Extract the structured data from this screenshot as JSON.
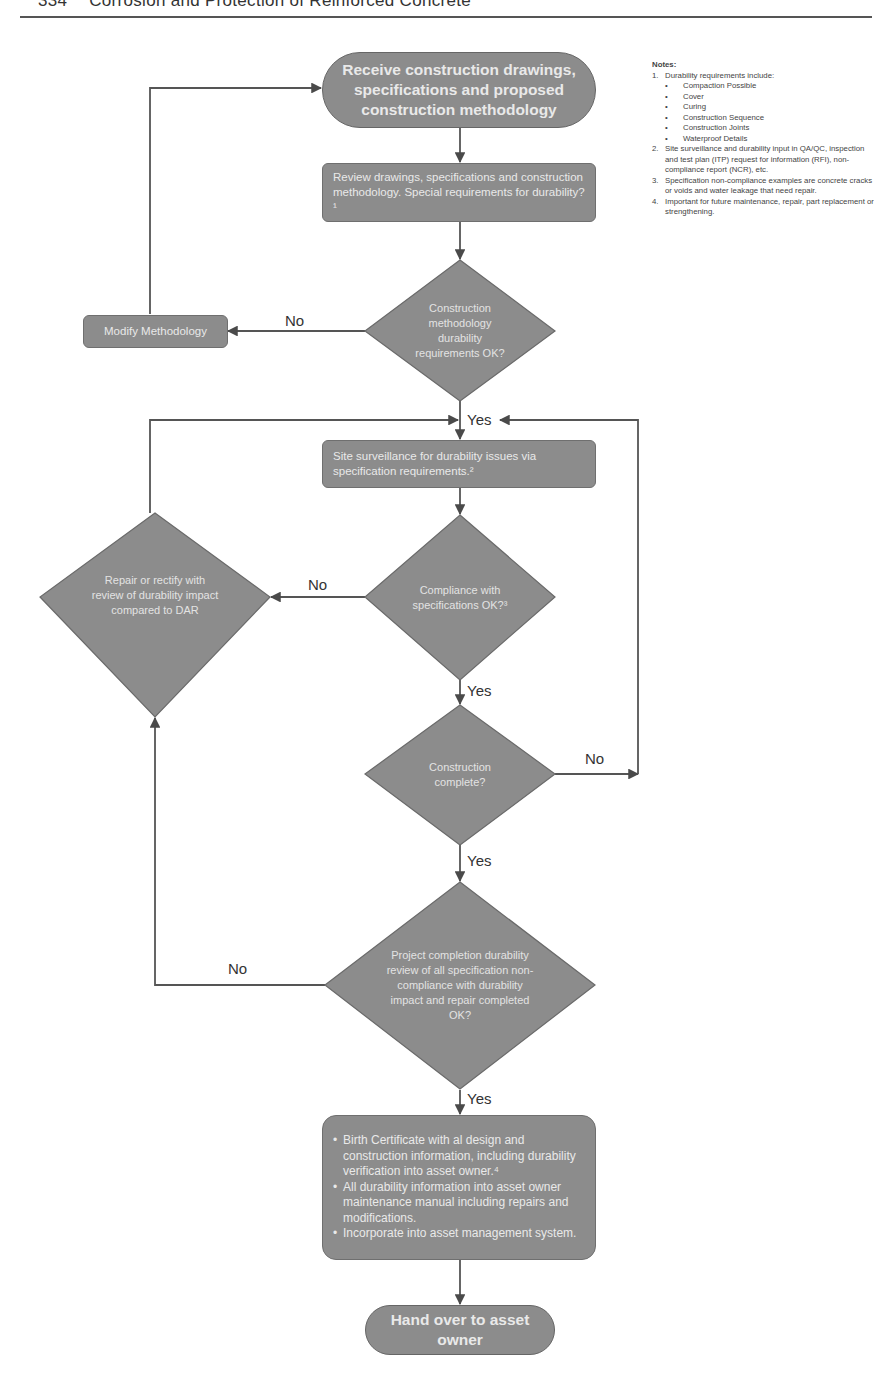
{
  "header": {
    "page_number": "334",
    "title": "Corrosion and Protection of Reinforced Concrete"
  },
  "notes": {
    "title": "Notes:",
    "items": [
      {
        "num": "1.",
        "text": "Durability requirements include:",
        "sub": [
          "Compaction Possible",
          "Cover",
          "Curing",
          "Construction Sequence",
          "Construction Joints",
          "Waterproof Details"
        ]
      },
      {
        "num": "2.",
        "text": "Site surveillance and durability input in QA/QC, inspection and test plan (ITP) request for information (RFI), non-compliance report (NCR), etc."
      },
      {
        "num": "3.",
        "text": "Specification non-compliance examples are concrete cracks or voids and water leakage that need repair."
      },
      {
        "num": "4.",
        "text": "Important for future maintenance, repair, part replacement or strengthening."
      }
    ]
  },
  "flowchart": {
    "start": "Receive construction drawings, specifications and proposed construction methodology",
    "review": "Review drawings, specifications and construction methodology. Special requirements for durability?¹",
    "decision_methodology": "Construction methodology durability requirements OK?",
    "modify": "Modify Methodology",
    "surveillance": "Site surveillance for durability issues via specification requirements.²",
    "decision_compliance": "Compliance with specifications OK?³",
    "repair": "Repair or rectify with review of durability impact compared to DAR",
    "decision_complete": "Construction complete?",
    "decision_project": "Project completion durability review of all specification non-compliance with durability impact and repair completed OK?",
    "final_items": [
      "Birth Certificate with al design and construction information, including durability verification into asset owner.⁴",
      "All durability information into asset owner maintenance manual including repairs and modifications.",
      "Incorporate into asset management system."
    ],
    "end": "Hand over to asset owner",
    "labels": {
      "no": "No",
      "yes": "Yes"
    }
  },
  "colors": {
    "shape_fill": "#8c8c8c",
    "shape_text": "#e9e9e9",
    "line": "#555555"
  }
}
